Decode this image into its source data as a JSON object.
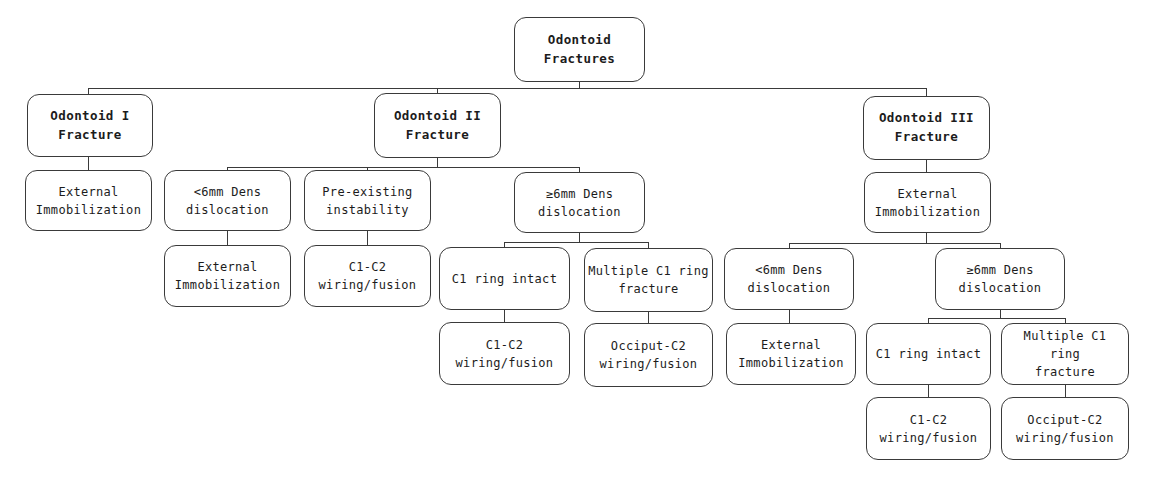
{
  "style": {
    "line_color": "#3a3a3a",
    "text_color": "#1c1c1c",
    "background": "#ffffff"
  },
  "tree": {
    "root": {
      "label": [
        "Odontoid",
        "Fractures"
      ],
      "children": [
        {
          "label": [
            "Odontoid I",
            "Fracture"
          ],
          "children": [
            {
              "label": [
                "External",
                "Immobilization"
              ]
            }
          ]
        },
        {
          "label": [
            "Odontoid II",
            "Fracture"
          ],
          "children": [
            {
              "label": [
                "<6mm Dens",
                "dislocation"
              ],
              "children": [
                {
                  "label": [
                    "External",
                    "Immobilization"
                  ]
                }
              ]
            },
            {
              "label": [
                "Pre-existing",
                "instability"
              ],
              "children": [
                {
                  "label": [
                    "C1-C2",
                    "wiring/fusion"
                  ]
                }
              ]
            },
            {
              "label": [
                "≥6mm Dens",
                "dislocation"
              ],
              "children": [
                {
                  "label": [
                    "C1 ring intact"
                  ],
                  "children": [
                    {
                      "label": [
                        "C1-C2",
                        "wiring/fusion"
                      ]
                    }
                  ]
                },
                {
                  "label": [
                    "Multiple C1 ring",
                    "fracture"
                  ],
                  "children": [
                    {
                      "label": [
                        "Occiput-C2",
                        "wiring/fusion"
                      ]
                    }
                  ]
                }
              ]
            }
          ]
        },
        {
          "label": [
            "Odontoid III",
            "Fracture"
          ],
          "children": [
            {
              "label": [
                "External",
                "Immobilization"
              ],
              "children": [
                {
                  "label": [
                    "<6mm Dens",
                    "dislocation"
                  ],
                  "children": [
                    {
                      "label": [
                        "External",
                        "Immobilization"
                      ]
                    }
                  ]
                },
                {
                  "label": [
                    "≥6mm Dens",
                    "dislocation"
                  ],
                  "children": [
                    {
                      "label": [
                        "C1 ring intact"
                      ],
                      "children": [
                        {
                          "label": [
                            "C1-C2",
                            "wiring/fusion"
                          ]
                        }
                      ]
                    },
                    {
                      "label": [
                        "Multiple C1 ring",
                        "fracture"
                      ],
                      "children": [
                        {
                          "label": [
                            "Occiput-C2",
                            "wiring/fusion"
                          ]
                        }
                      ]
                    }
                  ]
                }
              ]
            }
          ]
        }
      ]
    }
  }
}
